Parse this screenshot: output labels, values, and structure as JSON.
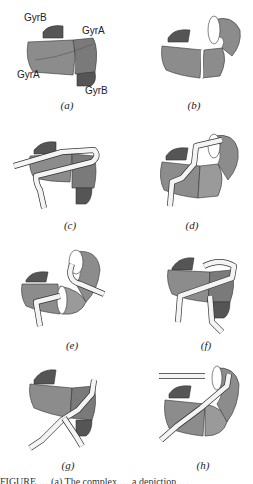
{
  "figure": {
    "panels": [
      {
        "id": "a",
        "label": "(a)",
        "annotations": [
          "GyrB",
          "GyrA",
          "GyrA",
          "GyrB"
        ]
      },
      {
        "id": "b",
        "label": "(b)"
      },
      {
        "id": "c",
        "label": "(c)"
      },
      {
        "id": "d",
        "label": "(d)"
      },
      {
        "id": "e",
        "label": "(e)"
      },
      {
        "id": "f",
        "label": "(f)"
      },
      {
        "id": "g",
        "label": "(g)"
      },
      {
        "id": "h",
        "label": "(h)"
      }
    ],
    "colors": {
      "body": "#8c8c8c",
      "body_dark": "#6e6e6e",
      "cap": "#555555",
      "dna": "#f4f4f4",
      "outline": "#333333"
    },
    "caption_partial": "FIGURE … (a) The complex … a depiction …"
  }
}
